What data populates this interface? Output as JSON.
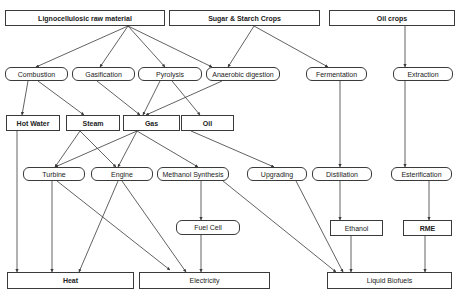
{
  "diagram": {
    "nodes": [
      {
        "id": "ligno",
        "label": "Lignocellulosic raw material",
        "shape": "rect",
        "bold": true,
        "x": 5,
        "y": 10,
        "w": 160,
        "h": 16
      },
      {
        "id": "sugar",
        "label": "Sugar & Starch Crops",
        "shape": "rect",
        "bold": true,
        "x": 169,
        "y": 10,
        "w": 151,
        "h": 16
      },
      {
        "id": "oilcrops",
        "label": "Oil crops",
        "shape": "rect",
        "bold": true,
        "x": 329,
        "y": 10,
        "w": 126,
        "h": 16
      },
      {
        "id": "combustion",
        "label": "Combustion",
        "shape": "round",
        "bold": false,
        "x": 5,
        "y": 67,
        "w": 63,
        "h": 14
      },
      {
        "id": "gasification",
        "label": "Gasification",
        "shape": "round",
        "bold": false,
        "x": 72,
        "y": 67,
        "w": 63,
        "h": 14
      },
      {
        "id": "pyrolysis",
        "label": "Pyrolysis",
        "shape": "round",
        "bold": false,
        "x": 138,
        "y": 67,
        "w": 64,
        "h": 14
      },
      {
        "id": "anaerobic",
        "label": "Anaerobic digestion",
        "shape": "round",
        "bold": false,
        "x": 206,
        "y": 67,
        "w": 74,
        "h": 14
      },
      {
        "id": "fermentation",
        "label": "Fermentation",
        "shape": "round",
        "bold": false,
        "x": 306,
        "y": 67,
        "w": 61,
        "h": 14
      },
      {
        "id": "extraction",
        "label": "Extraction",
        "shape": "round",
        "bold": false,
        "x": 393,
        "y": 67,
        "w": 60,
        "h": 14
      },
      {
        "id": "hotwater",
        "label": "Hot Water",
        "shape": "rect",
        "bold": true,
        "x": 6,
        "y": 115,
        "w": 54,
        "h": 16
      },
      {
        "id": "steam",
        "label": "Steam",
        "shape": "rect",
        "bold": true,
        "x": 66,
        "y": 115,
        "w": 54,
        "h": 16
      },
      {
        "id": "gas",
        "label": "Gas",
        "shape": "rect",
        "bold": true,
        "x": 123,
        "y": 115,
        "w": 57,
        "h": 16
      },
      {
        "id": "oil",
        "label": "Oil",
        "shape": "rect",
        "bold": true,
        "x": 181,
        "y": 115,
        "w": 53,
        "h": 16
      },
      {
        "id": "turbine",
        "label": "Turbine",
        "shape": "round",
        "bold": false,
        "x": 23,
        "y": 167,
        "w": 62,
        "h": 14
      },
      {
        "id": "engine",
        "label": "Engine",
        "shape": "round",
        "bold": false,
        "x": 91,
        "y": 167,
        "w": 62,
        "h": 14
      },
      {
        "id": "methanol",
        "label": "Methanol Synthesis",
        "shape": "round",
        "bold": false,
        "x": 157,
        "y": 167,
        "w": 72,
        "h": 14
      },
      {
        "id": "upgrading",
        "label": "Upgrading",
        "shape": "round",
        "bold": false,
        "x": 247,
        "y": 167,
        "w": 60,
        "h": 14
      },
      {
        "id": "distillation",
        "label": "Distillation",
        "shape": "round",
        "bold": false,
        "x": 312,
        "y": 167,
        "w": 60,
        "h": 14
      },
      {
        "id": "esterification",
        "label": "Esterification",
        "shape": "round",
        "bold": false,
        "x": 391,
        "y": 167,
        "w": 61,
        "h": 14
      },
      {
        "id": "fuelcell",
        "label": "Fuel Cell",
        "shape": "round",
        "bold": false,
        "x": 176,
        "y": 220,
        "w": 64,
        "h": 15
      },
      {
        "id": "ethanol",
        "label": "Ethanol",
        "shape": "rect",
        "bold": false,
        "x": 330,
        "y": 220,
        "w": 53,
        "h": 16
      },
      {
        "id": "rme",
        "label": "RME",
        "shape": "rect",
        "bold": true,
        "x": 403,
        "y": 220,
        "w": 49,
        "h": 16
      },
      {
        "id": "heat",
        "label": "Heat",
        "shape": "rect",
        "bold": true,
        "x": 7,
        "y": 272,
        "w": 127,
        "h": 17
      },
      {
        "id": "electricity",
        "label": "Electricity",
        "shape": "rect",
        "bold": false,
        "x": 139,
        "y": 272,
        "w": 131,
        "h": 17
      },
      {
        "id": "biofuels",
        "label": "Liquid Biofuels",
        "shape": "rect",
        "bold": false,
        "x": 327,
        "y": 272,
        "w": 125,
        "h": 17
      }
    ],
    "edges": [
      {
        "from": "ligno",
        "to": "combustion",
        "x1": 128,
        "y1": 26,
        "x2": 36,
        "y2": 67
      },
      {
        "from": "ligno",
        "to": "gasification",
        "x1": 128,
        "y1": 26,
        "x2": 100,
        "y2": 67
      },
      {
        "from": "ligno",
        "to": "pyrolysis",
        "x1": 128,
        "y1": 26,
        "x2": 165,
        "y2": 67
      },
      {
        "from": "ligno",
        "to": "anaerobic",
        "x1": 128,
        "y1": 26,
        "x2": 212,
        "y2": 67
      },
      {
        "from": "sugar",
        "to": "anaerobic",
        "x1": 254,
        "y1": 26,
        "x2": 228,
        "y2": 67
      },
      {
        "from": "sugar",
        "to": "fermentation",
        "x1": 254,
        "y1": 26,
        "x2": 328,
        "y2": 67
      },
      {
        "from": "oilcrops",
        "to": "extraction",
        "x1": 405,
        "y1": 26,
        "x2": 405,
        "y2": 67
      },
      {
        "from": "combustion",
        "to": "hotwater",
        "x1": 28,
        "y1": 81,
        "x2": 22,
        "y2": 115
      },
      {
        "from": "combustion",
        "to": "steam",
        "x1": 38,
        "y1": 81,
        "x2": 84,
        "y2": 115
      },
      {
        "from": "gasification",
        "to": "gas",
        "x1": 97,
        "y1": 81,
        "x2": 140,
        "y2": 115
      },
      {
        "from": "pyrolysis",
        "to": "gas",
        "x1": 160,
        "y1": 81,
        "x2": 143,
        "y2": 115
      },
      {
        "from": "pyrolysis",
        "to": "oil",
        "x1": 172,
        "y1": 81,
        "x2": 200,
        "y2": 115
      },
      {
        "from": "anaerobic",
        "to": "gas",
        "x1": 222,
        "y1": 81,
        "x2": 146,
        "y2": 115
      },
      {
        "from": "fermentation",
        "to": "distillation",
        "x1": 340,
        "y1": 81,
        "x2": 340,
        "y2": 167
      },
      {
        "from": "extraction",
        "to": "esterification",
        "x1": 405,
        "y1": 81,
        "x2": 405,
        "y2": 167
      },
      {
        "from": "steam",
        "to": "turbine",
        "x1": 80,
        "y1": 131,
        "x2": 55,
        "y2": 167
      },
      {
        "from": "steam",
        "to": "engine",
        "x1": 80,
        "y1": 131,
        "x2": 116,
        "y2": 167
      },
      {
        "from": "gas",
        "to": "turbine",
        "x1": 137,
        "y1": 131,
        "x2": 55,
        "y2": 167
      },
      {
        "from": "gas",
        "to": "engine",
        "x1": 137,
        "y1": 131,
        "x2": 118,
        "y2": 167
      },
      {
        "from": "gas",
        "to": "methanol",
        "x1": 137,
        "y1": 131,
        "x2": 198,
        "y2": 167
      },
      {
        "from": "oil",
        "to": "upgrading",
        "x1": 191,
        "y1": 131,
        "x2": 274,
        "y2": 167
      },
      {
        "from": "hotwater",
        "to": "heat",
        "x1": 17,
        "y1": 131,
        "x2": 17,
        "y2": 272
      },
      {
        "from": "turbine",
        "to": "heat",
        "x1": 52,
        "y1": 181,
        "x2": 52,
        "y2": 272
      },
      {
        "from": "turbine",
        "to": "electricity",
        "x1": 57,
        "y1": 181,
        "x2": 170,
        "y2": 270
      },
      {
        "from": "engine",
        "to": "heat",
        "x1": 118,
        "y1": 181,
        "x2": 79,
        "y2": 272
      },
      {
        "from": "engine",
        "to": "electricity",
        "x1": 122,
        "y1": 181,
        "x2": 186,
        "y2": 272
      },
      {
        "from": "methanol",
        "to": "fuelcell",
        "x1": 201,
        "y1": 181,
        "x2": 201,
        "y2": 220
      },
      {
        "from": "methanol",
        "to": "biofuels",
        "x1": 223,
        "y1": 181,
        "x2": 336,
        "y2": 272
      },
      {
        "from": "upgrading",
        "to": "biofuels",
        "x1": 296,
        "y1": 181,
        "x2": 343,
        "y2": 272
      },
      {
        "from": "fuelcell",
        "to": "electricity",
        "x1": 201,
        "y1": 235,
        "x2": 201,
        "y2": 272
      },
      {
        "from": "distillation",
        "to": "ethanol",
        "x1": 340,
        "y1": 181,
        "x2": 340,
        "y2": 220
      },
      {
        "from": "esterification",
        "to": "rme",
        "x1": 429,
        "y1": 181,
        "x2": 429,
        "y2": 220
      },
      {
        "from": "ethanol",
        "to": "biofuels",
        "x1": 351,
        "y1": 236,
        "x2": 351,
        "y2": 272
      },
      {
        "from": "rme",
        "to": "biofuels",
        "x1": 425,
        "y1": 236,
        "x2": 425,
        "y2": 272
      }
    ],
    "colors": {
      "line": "#3a3a3a",
      "text": "#222222",
      "background": "#ffffff"
    }
  }
}
